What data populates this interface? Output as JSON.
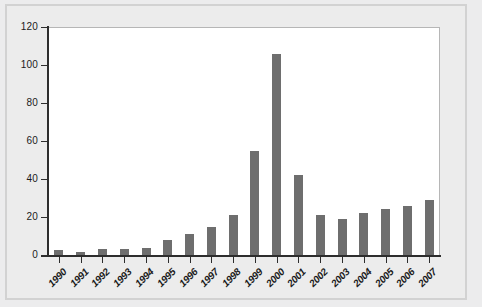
{
  "chart_data": {
    "type": "bar",
    "title": "",
    "subtitle": "",
    "xlabel": "",
    "ylabel": "",
    "categories": [
      "1990",
      "1991",
      "1992",
      "1993",
      "1994",
      "1995",
      "1996",
      "1997",
      "1998",
      "1999",
      "2000",
      "2001",
      "2002",
      "2003",
      "2004",
      "2005",
      "2006",
      "2007"
    ],
    "values": [
      2.5,
      1.5,
      3,
      3,
      3.5,
      8,
      11,
      15,
      21,
      55,
      106,
      42,
      21,
      19,
      22,
      24,
      26,
      29
    ],
    "series": [
      {
        "name": "",
        "values": [
          2.5,
          1.5,
          3,
          3,
          3.5,
          8,
          11,
          15,
          21,
          55,
          106,
          42,
          21,
          19,
          22,
          24,
          26,
          29
        ]
      }
    ],
    "ylim": [
      0,
      120
    ],
    "xlim_categories": 18,
    "y_ticks": [
      0,
      20,
      40,
      60,
      80,
      100,
      120
    ],
    "y_tick_labels": [
      "0",
      "20",
      "40",
      "60",
      "80",
      "100",
      "120"
    ],
    "grid": false,
    "legend": null,
    "legend_position": "none",
    "annotations": [],
    "bar_color": "#6e6e6e",
    "plot_background": "#ffffff",
    "figure_background": "#ececec",
    "axis_color": "#2d2d2d",
    "frame_color": "#d2d2d2"
  }
}
